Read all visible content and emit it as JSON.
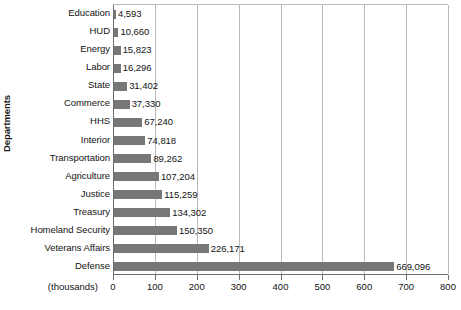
{
  "chart_data": {
    "type": "bar",
    "orientation": "horizontal",
    "title": "",
    "subtitle": "",
    "xlabel": "(thousands)",
    "ylabel": "Departments",
    "xlim": [
      0,
      800
    ],
    "xticks": [
      0,
      100,
      200,
      300,
      400,
      500,
      600,
      700,
      800
    ],
    "xtick_labels": [
      "0",
      "100",
      "200",
      "300",
      "400",
      "500",
      "600",
      "700",
      "800"
    ],
    "grid": true,
    "grid_axis": "x",
    "legend": false,
    "units_note": "(thousands)",
    "bar_color": "#777777",
    "gridline_color": "#b9b9b9",
    "axis_color": "#6e6e6e",
    "categories": [
      "Education",
      "HUD",
      "Energy",
      "Labor",
      "State",
      "Commerce",
      "HHS",
      "Interior",
      "Transportation",
      "Agriculture",
      "Justice",
      "Treasury",
      "Homeland Security",
      "Veterans Affairs",
      "Defense"
    ],
    "values": [
      4593,
      10660,
      15823,
      16296,
      31402,
      37330,
      67240,
      74818,
      89262,
      107204,
      115259,
      134302,
      150350,
      226171,
      669096
    ],
    "value_labels": [
      "4,593",
      "10,660",
      "15,823",
      "16,296",
      "31,402",
      "37,330",
      "67,240",
      "74,818",
      "89,262",
      "107,204",
      "115,259",
      "134,302",
      "150,350",
      "226,171",
      "669,096"
    ]
  }
}
